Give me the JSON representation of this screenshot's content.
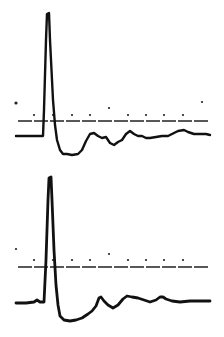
{
  "chart_data": [
    {
      "type": "line",
      "title": "",
      "xlabel": "",
      "ylabel": "",
      "grid": false,
      "legend": null,
      "description": "Upper recording trace: sharp spike followed by undershoot and slow recovery",
      "reference_line_y": 121,
      "time_markers": [
        {
          "x": 16,
          "y": 103
        },
        {
          "x": 34,
          "y": 115
        },
        {
          "x": 53,
          "y": 115
        },
        {
          "x": 72,
          "y": 115
        },
        {
          "x": 90,
          "y": 115
        },
        {
          "x": 109,
          "y": 108
        },
        {
          "x": 128,
          "y": 115
        },
        {
          "x": 146,
          "y": 115
        },
        {
          "x": 164,
          "y": 115
        },
        {
          "x": 183,
          "y": 115
        },
        {
          "x": 202,
          "y": 102
        }
      ],
      "series": [
        {
          "name": "trace-1",
          "points": [
            [
              16,
              136
            ],
            [
              30,
              136
            ],
            [
              43,
              136
            ],
            [
              44,
              110
            ],
            [
              46,
              40
            ],
            [
              47,
              14
            ],
            [
              49,
              13
            ],
            [
              50,
              40
            ],
            [
              53,
              100
            ],
            [
              55,
              125
            ],
            [
              57,
              140
            ],
            [
              60,
              150
            ],
            [
              63,
              154
            ],
            [
              67,
              154
            ],
            [
              72,
              155
            ],
            [
              78,
              154
            ],
            [
              82,
              150
            ],
            [
              86,
              141
            ],
            [
              90,
              134
            ],
            [
              94,
              133
            ],
            [
              98,
              136
            ],
            [
              102,
              138
            ],
            [
              106,
              137
            ],
            [
              110,
              143
            ],
            [
              114,
              145
            ],
            [
              118,
              142
            ],
            [
              122,
              140
            ],
            [
              126,
              134
            ],
            [
              130,
              131
            ],
            [
              134,
              134
            ],
            [
              138,
              136
            ],
            [
              142,
              136
            ],
            [
              146,
              138
            ],
            [
              150,
              138
            ],
            [
              156,
              137
            ],
            [
              162,
              136
            ],
            [
              168,
              136
            ],
            [
              174,
              133
            ],
            [
              178,
              131
            ],
            [
              184,
              130
            ],
            [
              188,
              132
            ],
            [
              194,
              134
            ],
            [
              200,
              134
            ],
            [
              206,
              134
            ],
            [
              210,
              135
            ]
          ]
        }
      ]
    },
    {
      "type": "line",
      "title": "",
      "xlabel": "",
      "ylabel": "",
      "grid": false,
      "legend": null,
      "description": "Lower recording trace: sharp spike followed by undershoot and slow recovery",
      "reference_line_y": 267,
      "time_markers": [
        {
          "x": 16,
          "y": 249
        },
        {
          "x": 34,
          "y": 260
        },
        {
          "x": 53,
          "y": 260
        },
        {
          "x": 72,
          "y": 260
        },
        {
          "x": 90,
          "y": 260
        },
        {
          "x": 109,
          "y": 254
        },
        {
          "x": 128,
          "y": 260
        },
        {
          "x": 146,
          "y": 260
        },
        {
          "x": 164,
          "y": 260
        },
        {
          "x": 183,
          "y": 260
        }
      ],
      "series": [
        {
          "name": "trace-2",
          "points": [
            [
              16,
              303
            ],
            [
              26,
              303
            ],
            [
              34,
              302
            ],
            [
              37,
              300
            ],
            [
              40,
              302
            ],
            [
              44,
              302
            ],
            [
              46,
              260
            ],
            [
              48,
              200
            ],
            [
              49,
              178
            ],
            [
              51,
              177
            ],
            [
              52,
              200
            ],
            [
              54,
              250
            ],
            [
              56,
              285
            ],
            [
              58,
              305
            ],
            [
              60,
              316
            ],
            [
              64,
              320
            ],
            [
              70,
              321
            ],
            [
              76,
              320
            ],
            [
              82,
              318
            ],
            [
              88,
              314
            ],
            [
              92,
              311
            ],
            [
              96,
              306
            ],
            [
              99,
              298
            ],
            [
              101,
              297
            ],
            [
              104,
              301
            ],
            [
              108,
              305
            ],
            [
              113,
              308
            ],
            [
              118,
              305
            ],
            [
              123,
              299
            ],
            [
              127,
              296
            ],
            [
              132,
              297
            ],
            [
              138,
              298
            ],
            [
              144,
              300
            ],
            [
              150,
              302
            ],
            [
              156,
              300
            ],
            [
              160,
              297
            ],
            [
              163,
              297
            ],
            [
              166,
              299
            ],
            [
              172,
              301
            ],
            [
              180,
              302
            ],
            [
              190,
              301
            ],
            [
              200,
              301
            ],
            [
              210,
              301
            ]
          ]
        }
      ]
    }
  ]
}
